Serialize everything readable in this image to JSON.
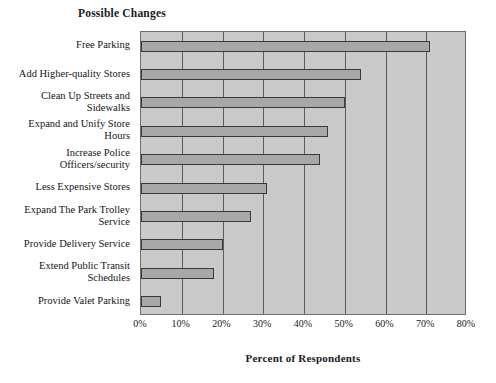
{
  "chart_data": {
    "type": "bar",
    "orientation": "horizontal",
    "title": "Possible Changes",
    "xlabel": "Percent of Respondents",
    "ylabel": "",
    "xlim": [
      0,
      80
    ],
    "xtick_labels": [
      "0%",
      "10%",
      "20%",
      "30%",
      "40%",
      "50%",
      "60%",
      "70%",
      "80%"
    ],
    "xtick_values": [
      0,
      10,
      20,
      30,
      40,
      50,
      60,
      70,
      80
    ],
    "grid": true,
    "legend": null,
    "categories": [
      "Free Parking",
      "Add Higher-quality Stores",
      "Clean Up Streets and Sidewalks",
      "Expand and Unify Store Hours",
      "Increase Police Officers/security",
      "Less Expensive Stores",
      "Expand The Park Trolley Service",
      "Provide Delivery Service",
      "Extend Public Transit Schedules",
      "Provide Valet Parking"
    ],
    "category_lines": [
      [
        "Free Parking"
      ],
      [
        "Add Higher-quality Stores"
      ],
      [
        "Clean Up Streets and",
        "Sidewalks"
      ],
      [
        "Expand and Unify Store",
        "Hours"
      ],
      [
        "Increase Police",
        "Officers/security"
      ],
      [
        "Less Expensive Stores"
      ],
      [
        "Expand The Park Trolley",
        "Service"
      ],
      [
        "Provide Delivery Service"
      ],
      [
        "Extend Public Transit",
        "Schedules"
      ],
      [
        "Provide Valet Parking"
      ]
    ],
    "values": [
      71,
      54,
      50,
      46,
      44,
      31,
      27,
      20,
      18,
      5
    ],
    "colors": {
      "plot_background": "#c9c9c9",
      "bar_fill": "#a8a8a8",
      "bar_border": "#3a3a3a",
      "gridline": "#5c5c5c",
      "axis": "#6d6d6d",
      "text": "#141414"
    }
  }
}
